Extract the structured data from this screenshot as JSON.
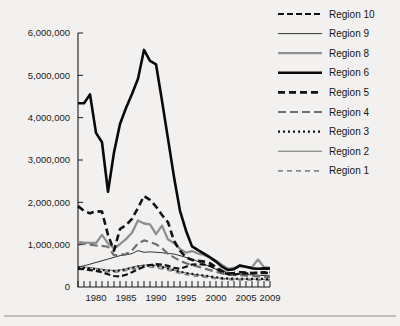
{
  "chart_data": {
    "type": "line",
    "title": "",
    "xlabel": "",
    "ylabel": "",
    "xlim": [
      1977,
      2009
    ],
    "ylim": [
      0,
      6000000
    ],
    "grid": false,
    "legend_position": "top-right",
    "y_ticks": [
      0,
      1000000,
      2000000,
      3000000,
      4000000,
      5000000,
      6000000
    ],
    "y_tick_labels": [
      "0",
      "1,000,000",
      "2,000,000",
      "3,000,000",
      "4,000,000",
      "5,000,000",
      "6,000,000"
    ],
    "x_ticks": [
      1980,
      1985,
      1990,
      1995,
      2000,
      2005,
      2009
    ],
    "x_tick_labels": [
      "1980",
      "1985",
      "1990",
      "1995",
      "2000",
      "2005",
      "2009"
    ],
    "x_minor_ticks": [
      1977,
      1978,
      1979,
      1980,
      1981,
      1982,
      1983,
      1984,
      1985,
      1986,
      1987,
      1988,
      1989,
      1990,
      1991,
      1992,
      1993,
      1994,
      1995,
      1996,
      1997,
      1998,
      1999,
      2000,
      2001,
      2002,
      2003,
      2004,
      2005,
      2006,
      2007,
      2008,
      2009
    ],
    "x": [
      1977,
      1978,
      1979,
      1980,
      1981,
      1982,
      1983,
      1984,
      1985,
      1986,
      1987,
      1988,
      1989,
      1990,
      1991,
      1992,
      1993,
      1994,
      1995,
      1996,
      1997,
      1998,
      1999,
      2000,
      2001,
      2002,
      2003,
      2004,
      2005,
      2006,
      2007,
      2008,
      2009
    ],
    "series": [
      {
        "name": "Region 10",
        "color": "#111111",
        "width": 2.2,
        "dash": "6,3",
        "values": [
          430000,
          420000,
          400000,
          380000,
          350000,
          300000,
          260000,
          250000,
          290000,
          350000,
          420000,
          480000,
          520000,
          540000,
          530000,
          500000,
          450000,
          430000,
          480000,
          530000,
          540000,
          530000,
          500000,
          430000,
          350000,
          300000,
          300000,
          310000,
          320000,
          330000,
          340000,
          350000,
          345000
        ]
      },
      {
        "name": "Region 9",
        "color": "#1d1d1d",
        "width": 0.9,
        "dash": "",
        "values": [
          470000,
          500000,
          540000,
          580000,
          620000,
          660000,
          700000,
          740000,
          760000,
          790000,
          860000,
          820000,
          830000,
          820000,
          810000,
          790000,
          780000,
          740000,
          700000,
          660000,
          600000,
          540000,
          480000,
          420000,
          380000,
          340000,
          310000,
          300000,
          290000,
          290000,
          280000,
          270000,
          265000
        ]
      },
      {
        "name": "Region 8",
        "color": "#8f8f8f",
        "width": 2.3,
        "dash": "",
        "values": [
          1060000,
          1050000,
          1040000,
          1040000,
          1230000,
          1030000,
          910000,
          1010000,
          1130000,
          1280000,
          1570000,
          1500000,
          1480000,
          1250000,
          1450000,
          1120000,
          1040000,
          900000,
          810000,
          850000,
          790000,
          760000,
          700000,
          620000,
          520000,
          430000,
          450000,
          490000,
          470000,
          470000,
          650000,
          470000,
          460000
        ]
      },
      {
        "name": "Region 6",
        "color": "#0a0a0a",
        "width": 2.6,
        "dash": "",
        "values": [
          4340000,
          4340000,
          4550000,
          3640000,
          3420000,
          2250000,
          3180000,
          3850000,
          4230000,
          4560000,
          4920000,
          5600000,
          5340000,
          5260000,
          4400000,
          3500000,
          2600000,
          1800000,
          1330000,
          960000,
          870000,
          790000,
          700000,
          600000,
          480000,
          400000,
          420000,
          510000,
          480000,
          440000,
          430000,
          440000,
          435000
        ]
      },
      {
        "name": "Region 5",
        "color": "#121212",
        "width": 2.6,
        "dash": "7,4",
        "values": [
          1910000,
          1800000,
          1740000,
          1790000,
          1780000,
          1230000,
          860000,
          1370000,
          1460000,
          1610000,
          1870000,
          2150000,
          2060000,
          1900000,
          1700000,
          1530000,
          1090000,
          860000,
          700000,
          640000,
          620000,
          600000,
          560000,
          470000,
          380000,
          320000,
          330000,
          350000,
          340000,
          330000,
          330000,
          335000,
          330000
        ]
      },
      {
        "name": "Region 4",
        "color": "#6f6f6f",
        "width": 2.2,
        "dash": "8,4",
        "values": [
          1060000,
          1020000,
          1000000,
          980000,
          970000,
          950000,
          750000,
          760000,
          780000,
          860000,
          1030000,
          1100000,
          1060000,
          1010000,
          920000,
          780000,
          700000,
          620000,
          560000,
          520000,
          480000,
          440000,
          400000,
          360000,
          320000,
          290000,
          280000,
          280000,
          270000,
          260000,
          250000,
          240000,
          235000
        ]
      },
      {
        "name": "Region 3",
        "color": "#151515",
        "width": 2.2,
        "dash": "2,3"
      },
      {
        "name": "Region 2",
        "color": "#6b6b6b",
        "width": 1.0,
        "dash": ""
      },
      {
        "name": "Region 1",
        "color": "#8a8a8a",
        "width": 1.8,
        "dash": "5,4"
      }
    ],
    "series_extra_values": {
      "Region 3": [
        460000,
        450000,
        440000,
        420000,
        400000,
        390000,
        380000,
        390000,
        420000,
        450000,
        480000,
        500000,
        510000,
        500000,
        470000,
        440000,
        400000,
        360000,
        330000,
        310000,
        290000,
        270000,
        250000,
        230000,
        210000,
        200000,
        195000,
        195000,
        195000,
        190000,
        190000,
        190000,
        185000
      ],
      "Region 2": [
        480000,
        470000,
        460000,
        440000,
        420000,
        400000,
        390000,
        400000,
        430000,
        470000,
        500000,
        520000,
        520000,
        510000,
        480000,
        440000,
        400000,
        360000,
        330000,
        305000,
        285000,
        265000,
        245000,
        225000,
        205000,
        195000,
        190000,
        190000,
        188000,
        185000,
        185000,
        182000,
        180000
      ],
      "Region 1": [
        440000,
        430000,
        420000,
        400000,
        380000,
        360000,
        350000,
        360000,
        390000,
        420000,
        450000,
        470000,
        470000,
        460000,
        430000,
        400000,
        360000,
        320000,
        290000,
        270000,
        250000,
        235000,
        220000,
        200000,
        185000,
        175000,
        170000,
        170000,
        168000,
        165000,
        165000,
        162000,
        160000
      ]
    }
  },
  "legend": {
    "items": [
      {
        "label": "Region 10"
      },
      {
        "label": "Region 9"
      },
      {
        "label": "Region 8"
      },
      {
        "label": "Region 6"
      },
      {
        "label": "Region 5"
      },
      {
        "label": "Region 4"
      },
      {
        "label": "Region 3"
      },
      {
        "label": "Region 2"
      },
      {
        "label": "Region 1"
      }
    ]
  },
  "colors": {
    "background": "#f3f1ef",
    "axis": "#1a1a1a",
    "text": "#141414",
    "rule": "#8d8d8d"
  }
}
